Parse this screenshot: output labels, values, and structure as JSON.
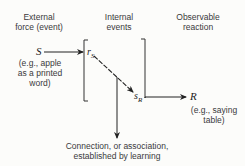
{
  "headers": {
    "external": [
      "External",
      "force (event)"
    ],
    "internal": [
      "Internal",
      "events"
    ],
    "observable": [
      "Observable",
      "reaction"
    ]
  },
  "nodes": {
    "S": "S",
    "rS_base": "r",
    "rS_sub": "S",
    "sR_base": "s",
    "sR_sub": "R",
    "R": "R"
  },
  "examples": {
    "stimulus": [
      "(e.g., apple",
      "as a printed",
      "word)"
    ],
    "response": [
      "(e.g., saying",
      "table)"
    ]
  },
  "caption": [
    "Connection, or association,",
    "established by learning"
  ]
}
